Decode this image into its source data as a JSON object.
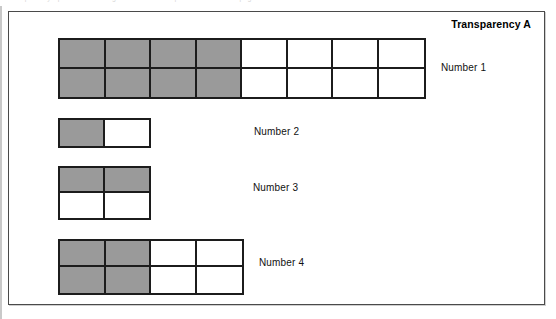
{
  "document": {
    "title": "Transparency A",
    "scan_header_ghost": "Transparency   ·   printed master   ·   grade fractions   ·   equivalent fractions   ·   page"
  },
  "colors": {
    "shaded_cell": "#9a9a9a",
    "unshaded_cell": "#ffffff",
    "cell_border": "#1c1c1c",
    "frame_border": "#4a4a4a",
    "page_background": "#ffffff",
    "label_text": "#111111"
  },
  "figures": [
    {
      "id": "figure-1",
      "label": "Number 1",
      "columns": 8,
      "rows": 2,
      "total_cells": 16,
      "shaded_cells": 8,
      "shaded_columns": 4,
      "fraction": "8/16"
    },
    {
      "id": "figure-2",
      "label": "Number 2",
      "columns": 2,
      "rows": 1,
      "total_cells": 2,
      "shaded_cells": 1,
      "shaded_columns": 1,
      "fraction": "1/2"
    },
    {
      "id": "figure-3",
      "label": "Number 3",
      "columns": 2,
      "rows": 2,
      "total_cells": 4,
      "shaded_cells": 2,
      "shaded_rows": 1,
      "fraction": "2/4"
    },
    {
      "id": "figure-4",
      "label": "Number 4",
      "columns": 4,
      "rows": 2,
      "total_cells": 8,
      "shaded_cells": 4,
      "shaded_columns": 2,
      "fraction": "4/8"
    }
  ]
}
